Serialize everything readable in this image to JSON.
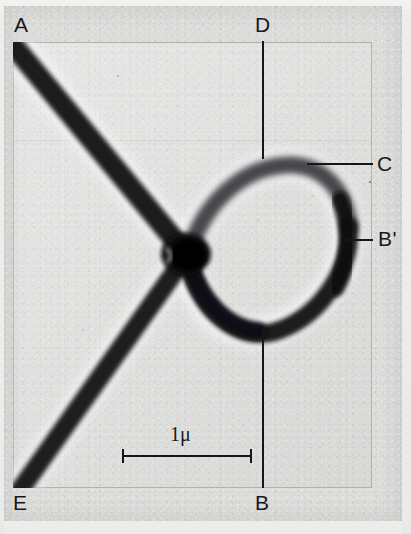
{
  "figure": {
    "kind": "electron-micrograph",
    "background_color": "#dcdcda",
    "ink_color": "#161618",
    "fiber_color": "#121214"
  },
  "labels": {
    "a": "A",
    "b": "B",
    "b_prime": "B'",
    "c": "C",
    "d": "D",
    "e": "E"
  },
  "scale_bar": {
    "text": "1μ",
    "value": 1,
    "unit": "μ",
    "length_px": 130,
    "x_start": 122,
    "x_end": 252,
    "y": 455
  },
  "annotations": {
    "leader_c": "leader-line-to-c",
    "leader_b_prime": "leader-line-to-b-prime",
    "axis_d": "vertical-reference-line-d",
    "axis_b": "vertical-reference-line-b"
  },
  "geometry": {
    "plate": {
      "x": 4,
      "y": 6,
      "w": 398,
      "h": 515
    },
    "photo": {
      "x": 13,
      "y": 42,
      "w": 359,
      "h": 446
    },
    "knot": {
      "x": 186,
      "y": 254
    },
    "label_positions": {
      "a": {
        "x": 14,
        "y": 14
      },
      "d": {
        "x": 255,
        "y": 14
      },
      "c": {
        "x": 376,
        "y": 153
      },
      "b_prime": {
        "x": 378,
        "y": 228
      },
      "e": {
        "x": 13,
        "y": 491
      },
      "b": {
        "x": 255,
        "y": 491
      }
    }
  }
}
